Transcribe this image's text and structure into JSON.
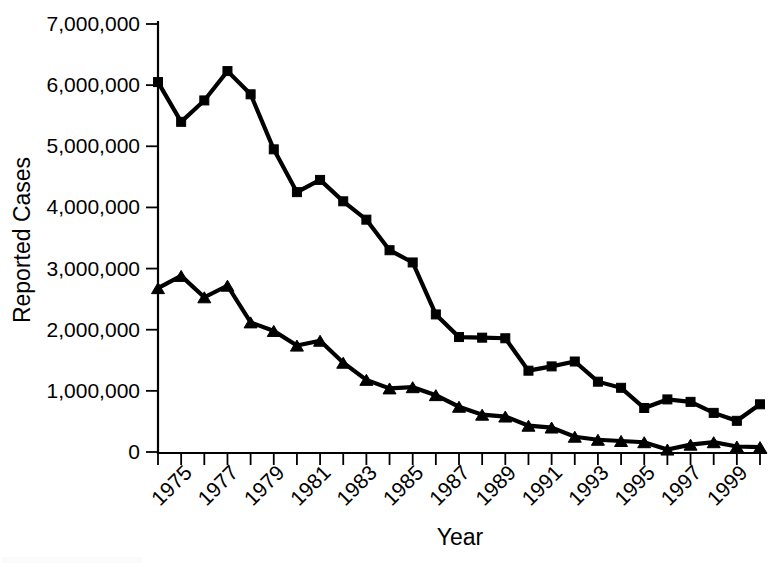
{
  "chart_data": {
    "type": "line",
    "title": "",
    "xlabel": "Year",
    "ylabel": "Reported Cases",
    "grid": false,
    "legend": "none",
    "x": [
      1974,
      1975,
      1976,
      1977,
      1978,
      1979,
      1980,
      1981,
      1982,
      1983,
      1984,
      1985,
      1986,
      1987,
      1988,
      1989,
      1990,
      1991,
      1992,
      1993,
      1994,
      1995,
      1996,
      1997,
      1998,
      1999,
      2000
    ],
    "xlim": [
      1974,
      2000
    ],
    "ylim": [
      0,
      7000000
    ],
    "ytick_values": [
      0,
      1000000,
      2000000,
      3000000,
      4000000,
      5000000,
      6000000,
      7000000
    ],
    "ytick_labels": [
      "0",
      "1,000,000",
      "2,000,000",
      "3,000,000",
      "4,000,000",
      "5,000,000",
      "6,000,000",
      "7,000,000"
    ],
    "xtick_values": [
      1975,
      1977,
      1979,
      1981,
      1983,
      1985,
      1987,
      1989,
      1991,
      1993,
      1995,
      1997,
      1999
    ],
    "xtick_labels": [
      "1975",
      "1977",
      "1979",
      "1981",
      "1983",
      "1985",
      "1987",
      "1989",
      "1991",
      "1993",
      "1995",
      "1997",
      "1999"
    ],
    "xtick_label_rotation": -45,
    "series": [
      {
        "name": "square-series",
        "marker": "square",
        "color": "#000000",
        "values": [
          6050000,
          5400000,
          5750000,
          6230000,
          5850000,
          4950000,
          4250000,
          4450000,
          4100000,
          3800000,
          3300000,
          3100000,
          2250000,
          1880000,
          1870000,
          1860000,
          1330000,
          1400000,
          1480000,
          1150000,
          1050000,
          720000,
          860000,
          820000,
          640000,
          510000,
          780000
        ]
      },
      {
        "name": "triangle-series",
        "marker": "triangle",
        "color": "#000000",
        "values": [
          2680000,
          2880000,
          2530000,
          2720000,
          2120000,
          1980000,
          1740000,
          1820000,
          1460000,
          1180000,
          1040000,
          1060000,
          930000,
          740000,
          610000,
          580000,
          430000,
          400000,
          250000,
          200000,
          180000,
          160000,
          40000,
          120000,
          160000,
          90000,
          80000
        ]
      }
    ]
  },
  "axes": {
    "y_axis_title": "Reported Cases",
    "x_axis_title": "Year"
  }
}
